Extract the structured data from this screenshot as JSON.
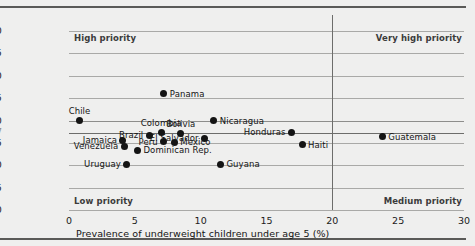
{
  "chart_data": {
    "type": "scatter",
    "title": "",
    "xlabel": "Prevalence of underweight children under age 5 (%)",
    "ylabel": "",
    "xlim": [
      0,
      30
    ],
    "ylim": [
      -20,
      20
    ],
    "xticks": [
      "0",
      "5",
      "10",
      "15",
      "20",
      "25",
      "30"
    ],
    "yticks": [
      "20",
      "15",
      "10",
      "5",
      "0",
      "-2.7",
      "-5",
      "-10",
      "-15",
      "-20"
    ],
    "grid": true,
    "legend": "none",
    "reference_lines": {
      "vertical_x": 20,
      "horizontal_y": -2.7,
      "horizontal_y_label": "-2.7"
    },
    "quadrant_labels": [
      {
        "name": "high-priority",
        "text": "High priority",
        "corner": "top-left"
      },
      {
        "name": "very-high-priority",
        "text": "Very high priority",
        "corner": "top-right"
      },
      {
        "name": "low-priority",
        "text": "Low priority",
        "corner": "bottom-left"
      },
      {
        "name": "medium-priority",
        "text": "Medium priority",
        "corner": "bottom-right"
      }
    ],
    "points": [
      {
        "label": "Chile",
        "x": 0.8,
        "y": 0.0,
        "pos": "t"
      },
      {
        "label": "Panama",
        "x": 7.2,
        "y": 6.0,
        "pos": "r"
      },
      {
        "label": "Colombia",
        "x": 7.0,
        "y": -2.7,
        "pos": "t"
      },
      {
        "label": "Nicaragua",
        "x": 11.0,
        "y": 0.0,
        "pos": "r"
      },
      {
        "label": "Brazil",
        "x": 6.1,
        "y": -3.3,
        "pos": "l"
      },
      {
        "label": "Bolivia",
        "x": 8.5,
        "y": -3.0,
        "pos": "t"
      },
      {
        "label": "Honduras",
        "x": 16.9,
        "y": -2.6,
        "pos": "l"
      },
      {
        "label": "Jamaica",
        "x": 4.1,
        "y": -4.4,
        "pos": "l"
      },
      {
        "label": "Peru",
        "x": 7.2,
        "y": -4.7,
        "pos": "l"
      },
      {
        "label": "Mexico",
        "x": 8.0,
        "y": -4.9,
        "pos": "r"
      },
      {
        "label": "El Salvador",
        "x": 10.3,
        "y": -4.0,
        "pos": "l"
      },
      {
        "label": "Haiti",
        "x": 17.7,
        "y": -5.4,
        "pos": "r"
      },
      {
        "label": "Guatemala",
        "x": 23.8,
        "y": -3.6,
        "pos": "r"
      },
      {
        "label": "Venezuela",
        "x": 4.2,
        "y": -5.7,
        "pos": "l"
      },
      {
        "label": "Dominican Rep.",
        "x": 5.2,
        "y": -6.7,
        "pos": "r"
      },
      {
        "label": "Uruguay",
        "x": 4.4,
        "y": -9.8,
        "pos": "l"
      },
      {
        "label": "Guyana",
        "x": 11.5,
        "y": -9.8,
        "pos": "r"
      }
    ]
  }
}
